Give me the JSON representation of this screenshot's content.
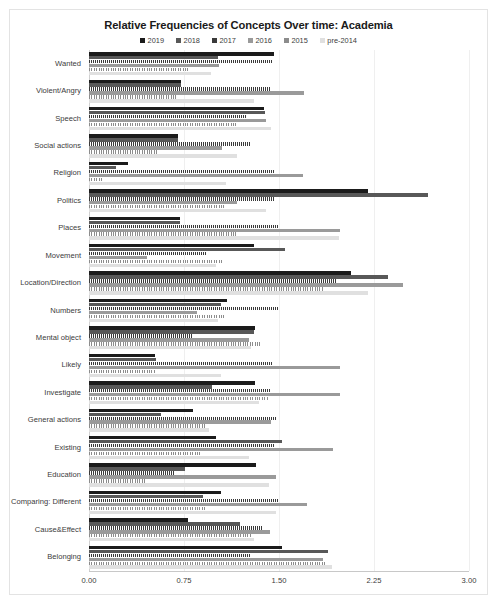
{
  "chart": {
    "title": "Relative Frequencies of Concepts Over time: Academia",
    "xlabel": "",
    "ylabel": "",
    "xticks": [
      "0.00",
      "0.75",
      "1.50",
      "2.25",
      "3.00"
    ]
  },
  "legend": {
    "position": "top-center",
    "entries": [
      {
        "label": "2019",
        "color": "#1b1b1b"
      },
      {
        "label": "2018",
        "color": "#585858"
      },
      {
        "label": "2017",
        "color": "#3a3a3a"
      },
      {
        "label": "2016",
        "color": "#9a9a9a"
      },
      {
        "label": "2015",
        "color": "#8c8c8c"
      },
      {
        "label": "pre-2014",
        "color": "#e0e0e0"
      }
    ]
  },
  "chart_data": {
    "type": "bar",
    "orientation": "horizontal",
    "title": "Relative Frequencies of Concepts Over time: Academia",
    "xlabel": "",
    "ylabel": "",
    "xlim": [
      0,
      3
    ],
    "xticks": [
      0,
      0.75,
      1.5,
      2.25,
      3
    ],
    "grid": true,
    "legend": [
      "2019",
      "2018",
      "2017",
      "2016",
      "2015",
      "pre-2014"
    ],
    "categories": [
      "Wanted",
      "Violent/Angry",
      "Speech",
      "Social actions",
      "Religion",
      "Politics",
      "Places",
      "Movement",
      "Location/Direction",
      "Numbers",
      "Mental object",
      "Likely",
      "Investigate",
      "General actions",
      "Existing",
      "Education",
      "Comparing: Different",
      "Cause&Effect",
      "Belonging"
    ],
    "series": [
      {
        "name": "2019",
        "color": "#1b1b1b",
        "values": [
          1.46,
          0.73,
          1.38,
          0.7,
          0.31,
          2.2,
          0.72,
          1.3,
          2.07,
          1.09,
          1.31,
          0.52,
          1.31,
          0.82,
          1.0,
          1.32,
          1.04,
          0.78,
          1.52
        ]
      },
      {
        "name": "2018",
        "color": "#585858",
        "values": [
          1.02,
          0.73,
          1.39,
          0.7,
          0.21,
          2.68,
          0.72,
          1.55,
          2.36,
          1.04,
          1.3,
          0.53,
          0.97,
          0.57,
          1.52,
          0.76,
          0.9,
          1.19,
          1.89
        ]
      },
      {
        "name": "2017",
        "color": "#3a3a3a",
        "values": [
          1.45,
          1.43,
          1.25,
          1.27,
          1.46,
          1.47,
          1.49,
          0.93,
          1.95,
          1.5,
          0.82,
          1.45,
          1.43,
          1.48,
          1.46,
          0.68,
          1.5,
          1.37,
          1.27
        ]
      },
      {
        "name": "2016",
        "color": "#9a9a9a",
        "values": [
          1.03,
          1.7,
          1.4,
          1.05,
          1.69,
          1.17,
          1.98,
          0.46,
          2.48,
          0.85,
          1.26,
          1.98,
          1.98,
          1.44,
          1.93,
          1.48,
          1.72,
          1.43,
          1.85
        ]
      },
      {
        "name": "2015",
        "color": "#8c8c8c",
        "values": [
          0.8,
          0.7,
          1.16,
          0.55,
          0.1,
          1.08,
          1.17,
          1.06,
          1.85,
          1.08,
          1.35,
          0.52,
          1.41,
          0.93,
          0.88,
          0.45,
          0.93,
          1.28,
          1.87
        ]
      },
      {
        "name": "pre-2014",
        "color": "#e0e0e0",
        "values": [
          0.96,
          1.3,
          1.44,
          1.17,
          1.08,
          1.4,
          1.97,
          1.0,
          2.2,
          1.02,
          1.28,
          1.04,
          1.34,
          0.95,
          1.26,
          1.42,
          1.48,
          1.3,
          1.92
        ]
      }
    ]
  }
}
